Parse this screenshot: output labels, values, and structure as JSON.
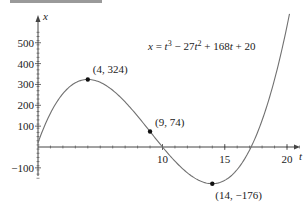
{
  "chart_data": {
    "type": "line",
    "equation": {
      "base": "x = t",
      "exp1": "3",
      "mid": " − 27t",
      "exp2": "2",
      "rest": " + 168t + 20"
    },
    "xlabel": "t",
    "ylabel": "x",
    "xlim": [
      0,
      21
    ],
    "ylim": [
      -180,
      580
    ],
    "x_ticks": [
      10,
      15,
      20
    ],
    "y_ticks": [
      -100,
      100,
      200,
      300,
      400,
      500
    ],
    "grid": false,
    "annotated_points": [
      {
        "t": 4,
        "x": 324,
        "label": "(4, 324)"
      },
      {
        "t": 9,
        "x": 74,
        "label": "(9, 74)"
      },
      {
        "t": 14,
        "x": -176,
        "label": "(14, −176)"
      }
    ],
    "colors": {
      "curve": "#707070",
      "axis": "#444444",
      "point": "#111111"
    }
  }
}
